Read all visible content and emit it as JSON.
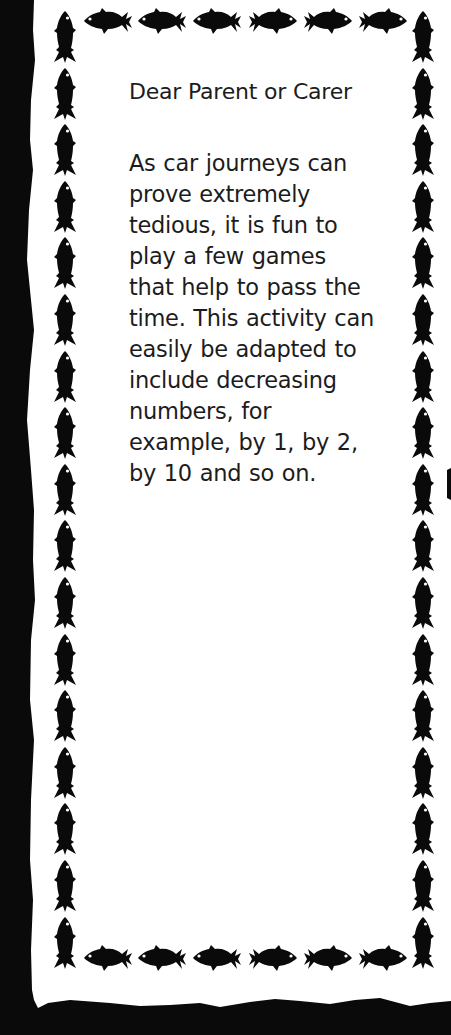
{
  "document": {
    "greeting": "Dear Parent or Carer",
    "body_lines": [
      "As car journeys can",
      "prove extremely",
      "tedious, it is fun to",
      "play a few games",
      "that help to pass the",
      "time. This activity can",
      "easily be adapted to",
      "include decreasing",
      "numbers, for",
      "example, by 1, by 2,",
      "by 10 and so on."
    ]
  },
  "border": {
    "motif": "fish-icon",
    "top_row": [
      "fish-left",
      "fish-left",
      "fish-left",
      "fish-right",
      "fish-right",
      "fish-right"
    ],
    "bottom_row": [
      "fish-left",
      "fish-left",
      "fish-left",
      "fish-right",
      "fish-right",
      "fish-right"
    ],
    "side_columns_count": 17,
    "colors": {
      "ink": "#0a0a0a",
      "paper": "#ffffff",
      "text": "#1c1c1c"
    }
  }
}
